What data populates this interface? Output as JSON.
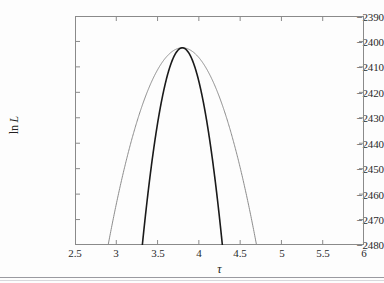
{
  "figure": {
    "background_color": "#fdfdfd",
    "frame_color": "#8a8a8a"
  },
  "axis_titles": {
    "y_prefix": "ln",
    "y_symbol": "L",
    "x_symbol": "τ"
  },
  "chart_data": {
    "type": "line",
    "title": "",
    "subtitle": "",
    "xlabel": "τ",
    "ylabel": "ln L",
    "grid": false,
    "legend": "none",
    "xlim": [
      2.5,
      6
    ],
    "ylim": [
      -2480,
      -2390
    ],
    "xticks": [
      2.5,
      3,
      3.5,
      4,
      4.5,
      5,
      5.5,
      6
    ],
    "xtick_labels": [
      "2.5",
      "3",
      "3.5",
      "4",
      "4.5",
      "5",
      "5.5",
      "6"
    ],
    "yticks": [
      -2390,
      -2400,
      -2410,
      -2420,
      -2430,
      -2440,
      -2450,
      -2460,
      -2470,
      -2480
    ],
    "ytick_labels": [
      "−2390",
      "−2400",
      "−2410",
      "−2420",
      "−2430",
      "−2440",
      "−2450",
      "−2460",
      "−2470",
      "−2480"
    ],
    "annotations": [],
    "series": [
      {
        "name": "wide profile",
        "color": "#8c8c8c",
        "linewidth": 1.0,
        "peak_x": 3.8,
        "peak_y": -2402.5,
        "curvature": -96,
        "x_at_ylim_low": [
          2.65,
          5.8
        ],
        "x": [
          2.65,
          2.75,
          2.85,
          2.95,
          3.05,
          3.15,
          3.25,
          3.35,
          3.45,
          3.55,
          3.65,
          3.75,
          3.8,
          3.85,
          3.95,
          4.05,
          4.15,
          4.25,
          4.35,
          4.45,
          4.55,
          4.65,
          4.75,
          4.85,
          4.95,
          5.05,
          5.15,
          5.25,
          5.35,
          5.45,
          5.55,
          5.65,
          5.75,
          5.8
        ],
        "y": [
          -2480.0,
          -2473.3,
          -2467.1,
          -2461.4,
          -2456.1,
          -2451.4,
          -2447.1,
          -2443.3,
          -2440.0,
          -2437.1,
          -2434.8,
          -2432.9,
          -2432.1,
          -2431.5,
          -2430.6,
          -2430.1,
          -2430.1,
          -2430.5,
          -2431.4,
          -2432.8,
          -2434.6,
          -2436.9,
          -2439.7,
          -2442.9,
          -2446.6,
          -2450.8,
          -2455.4,
          -2460.5,
          -2466.1,
          -2472.1,
          -2478.6,
          -2485.5,
          -2492.9,
          -2480.0
        ],
        "model": "parabola: y = -2402.5 - 96*(x-3.8)^2"
      },
      {
        "name": "narrow profile",
        "color": "#1a1a1a",
        "linewidth": 1.6,
        "peak_x": 3.8,
        "peak_y": -2402.5,
        "curvature": -330,
        "x_at_ylim_low": [
          3.2,
          4.8
        ],
        "x": [
          3.2,
          3.3,
          3.4,
          3.5,
          3.6,
          3.7,
          3.8,
          3.9,
          4.0,
          4.1,
          4.2,
          4.3,
          4.4,
          4.5,
          4.6,
          4.7,
          4.8
        ],
        "y": [
          -2480.3,
          -2465.0,
          -2455.3,
          -2432.2,
          -2415.7,
          -2405.8,
          -2402.5,
          -2405.8,
          -2415.7,
          -2432.2,
          -2455.3,
          -2465.0,
          -2480.3,
          -2480.3,
          -2480.3,
          -2480.3,
          -2480.3
        ],
        "model": "parabola: y = -2402.5 - 330*(x-3.8)^2"
      }
    ]
  }
}
